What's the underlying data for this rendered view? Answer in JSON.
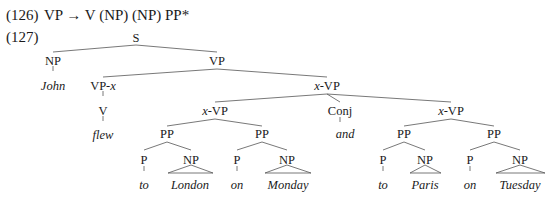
{
  "example_126": {
    "number": "(126)",
    "rule": "VP → V (NP) (NP) PP*"
  },
  "example_127": {
    "number": "(127)",
    "tree": {
      "S": "S",
      "NP_subj": "NP",
      "John": "John",
      "VP": "VP",
      "VP_x": "VP-",
      "VP_x_var": "x",
      "V": "V",
      "flew": "flew",
      "xVP_top_var": "x",
      "xVP_top": "-VP",
      "xVP_left_var": "x",
      "xVP_left": "-VP",
      "Conj": "Conj",
      "and": "and",
      "xVP_right_var": "x",
      "xVP_right": "-VP",
      "PP1": "PP",
      "P1": "P",
      "to1": "to",
      "NP1": "NP",
      "London": "London",
      "PP2": "PP",
      "P2": "P",
      "on1": "on",
      "NP2": "NP",
      "Monday": "Monday",
      "PP3": "PP",
      "P3": "P",
      "to2": "to",
      "NP3": "NP",
      "Paris": "Paris",
      "PP4": "PP",
      "P4": "P",
      "on2": "on",
      "NP4": "NP",
      "Tuesday": "Tuesday"
    }
  }
}
